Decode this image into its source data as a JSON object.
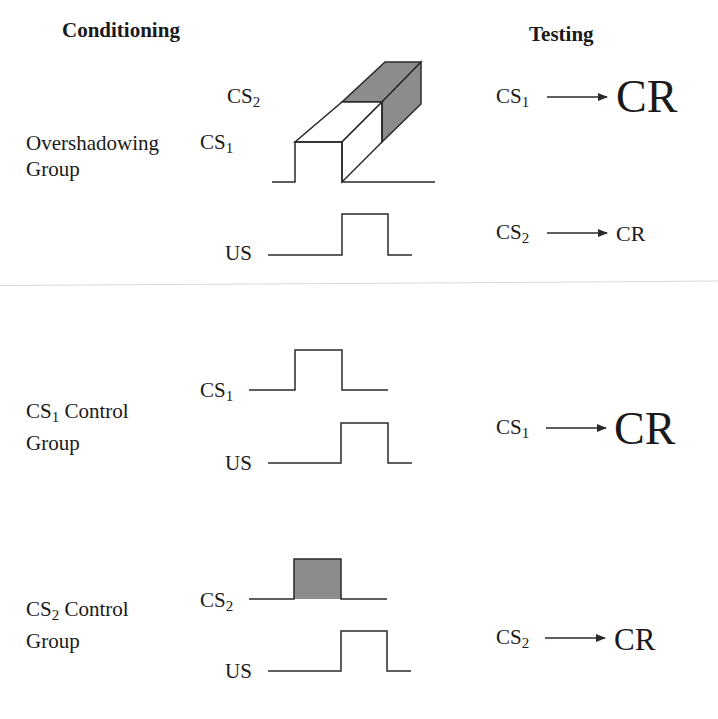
{
  "headers": {
    "conditioning": "Conditioning",
    "testing": "Testing"
  },
  "colors": {
    "line": "#2a2a2a",
    "shade": "#8c8c8c",
    "background": "#ffffff"
  },
  "groups": [
    {
      "name_line1": "Overshadowing",
      "name_line2": "Group",
      "conditioning_signals": [
        {
          "stimulus": "CS",
          "subscript": "2",
          "shaded": true
        },
        {
          "stimulus": "CS",
          "subscript": "1",
          "shaded": false
        },
        {
          "stimulus": "US",
          "subscript": ""
        }
      ],
      "tests": [
        {
          "stimulus": "CS",
          "subscript": "1",
          "response": "CR",
          "response_strength": "large"
        },
        {
          "stimulus": "CS",
          "subscript": "2",
          "response": "CR",
          "response_strength": "small"
        }
      ]
    },
    {
      "name_prefix": "CS",
      "name_subscript": "1",
      "name_line1": " Control",
      "name_line2": "Group",
      "conditioning_signals": [
        {
          "stimulus": "CS",
          "subscript": "1",
          "shaded": false
        },
        {
          "stimulus": "US",
          "subscript": ""
        }
      ],
      "tests": [
        {
          "stimulus": "CS",
          "subscript": "1",
          "response": "CR",
          "response_strength": "large"
        }
      ]
    },
    {
      "name_prefix": "CS",
      "name_subscript": "2",
      "name_line1": " Control",
      "name_line2": "Group",
      "conditioning_signals": [
        {
          "stimulus": "CS",
          "subscript": "2",
          "shaded": true
        },
        {
          "stimulus": "US",
          "subscript": ""
        }
      ],
      "tests": [
        {
          "stimulus": "CS",
          "subscript": "2",
          "response": "CR",
          "response_strength": "medium"
        }
      ]
    }
  ]
}
